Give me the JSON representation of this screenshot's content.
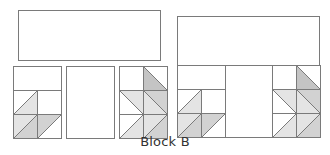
{
  "diagram": {
    "caption": "Block B",
    "colors": {
      "stroke": "#7a7a7a",
      "white": "#ffffff",
      "light": "#e4e4e4",
      "mid": "#d2d2d2",
      "dark": "#c4c4c4"
    },
    "unit_cell": 24,
    "pieces": [
      {
        "name": "top-band-piece",
        "x": 18,
        "y": 10,
        "w": 142,
        "h": 50
      },
      {
        "name": "center-rectangle-piece",
        "x": 66,
        "y": 66,
        "w": 48,
        "h": 72
      }
    ],
    "left_unit": {
      "cells": [
        {
          "row": 0,
          "col": 0,
          "span": 2,
          "type": "plain"
        },
        {
          "row": 1,
          "col": 0,
          "type": "bltr",
          "ul": "white",
          "lr": "light"
        },
        {
          "row": 1,
          "col": 1,
          "type": "plain"
        },
        {
          "row": 2,
          "col": 0,
          "type": "bltr",
          "ul": "light",
          "lr": "mid"
        },
        {
          "row": 2,
          "col": 1,
          "type": "bltr",
          "ul": "mid",
          "lr": "white"
        }
      ]
    },
    "right_unit": {
      "cells": [
        {
          "row": 0,
          "col": 0,
          "type": "plain"
        },
        {
          "row": 0,
          "col": 1,
          "type": "tlbr",
          "ur": "white",
          "ll": "dark"
        },
        {
          "row": 1,
          "col": 0,
          "type": "tlbr",
          "ur": "light",
          "ll": "white"
        },
        {
          "row": 1,
          "col": 1,
          "type": "tlbr",
          "ur": "mid",
          "ll": "light"
        },
        {
          "row": 2,
          "col": 0,
          "type": "bltr",
          "ul": "white",
          "lr": "light"
        },
        {
          "row": 2,
          "col": 1,
          "type": "bltr",
          "ul": "light",
          "lr": "mid"
        }
      ]
    },
    "unit_placements": [
      {
        "name": "left-unit-separate",
        "unit": "left_unit",
        "x": 13,
        "y": 66
      },
      {
        "name": "right-unit-separate",
        "unit": "right_unit",
        "x": 119,
        "y": 66
      },
      {
        "name": "left-unit-assembled",
        "unit": "left_unit",
        "x": 177,
        "y": 65
      },
      {
        "name": "right-unit-assembled",
        "unit": "right_unit",
        "x": 272,
        "y": 65
      }
    ],
    "assembled_block": {
      "x": 177,
      "y": 16,
      "w": 142,
      "h": 121,
      "band_h": 49,
      "center": {
        "x": 225,
        "y": 65,
        "w": 47,
        "h": 72
      }
    }
  }
}
